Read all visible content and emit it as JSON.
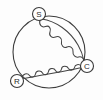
{
  "diagram": {
    "type": "motor-winding-schematic",
    "background_color": "#fdfdfd",
    "line_color": "#3d3d3d",
    "housing": {
      "name": "motor-housing",
      "shape": "circle",
      "center_x": 49,
      "center_y": 52,
      "radius": 36
    },
    "terminals": [
      {
        "id": "S",
        "label": "S",
        "name": "terminal-start",
        "meaning": "Start",
        "x": 39,
        "y": 14,
        "radius": 6.5
      },
      {
        "id": "C",
        "label": "C",
        "name": "terminal-common",
        "meaning": "Common",
        "x": 87,
        "y": 66,
        "radius": 6.5
      },
      {
        "id": "R",
        "label": "R",
        "name": "terminal-run",
        "meaning": "Run",
        "x": 17,
        "y": 81,
        "radius": 6.5
      }
    ],
    "windings": [
      {
        "name": "start-winding",
        "from": "S",
        "to": "C",
        "loops": 7,
        "position": "upper"
      },
      {
        "name": "run-winding",
        "from": "R",
        "to": "C",
        "loops": 6,
        "position": "lower"
      }
    ]
  }
}
